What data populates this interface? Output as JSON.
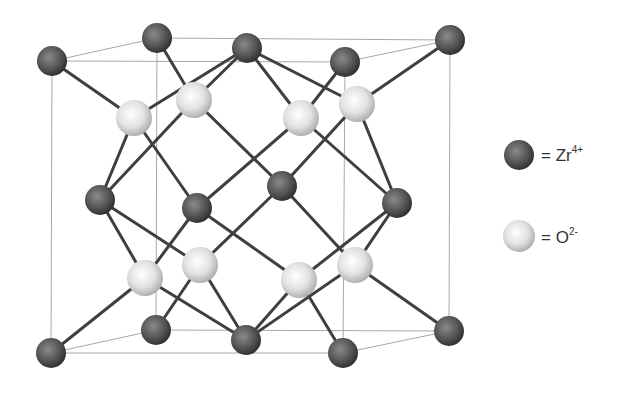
{
  "colors": {
    "zr_dark": "#3a3a3a",
    "zr_mid": "#6e6e6e",
    "o_light": "#f4f4f4",
    "o_mid": "#b8b8b8",
    "bond": "#3f3f3f",
    "box": "#a8a8a8"
  },
  "legend": [
    {
      "symbol": "Zr",
      "charge": "4+",
      "prefix": "= ",
      "type": "zr"
    },
    {
      "symbol": "O",
      "charge": "2-",
      "prefix": "= ",
      "type": "o"
    }
  ],
  "box": {
    "front": [
      [
        52,
        61
      ],
      [
        345,
        62
      ],
      [
        343,
        353
      ],
      [
        51,
        353
      ]
    ],
    "back": [
      [
        157,
        38
      ],
      [
        450,
        40
      ],
      [
        449,
        331
      ],
      [
        156,
        330
      ]
    ]
  },
  "zr_atoms": [
    [
      52,
      61
    ],
    [
      157,
      38
    ],
    [
      247,
      48
    ],
    [
      345,
      62
    ],
    [
      450,
      40
    ],
    [
      100,
      200
    ],
    [
      197,
      208
    ],
    [
      282,
      186
    ],
    [
      397,
      203
    ],
    [
      51,
      353
    ],
    [
      156,
      330
    ],
    [
      246,
      340
    ],
    [
      343,
      353
    ],
    [
      449,
      331
    ]
  ],
  "o_atoms": [
    [
      134,
      118
    ],
    [
      194,
      100
    ],
    [
      301,
      118
    ],
    [
      357,
      104
    ],
    [
      145,
      278
    ],
    [
      200,
      265
    ],
    [
      299,
      280
    ],
    [
      355,
      265
    ]
  ],
  "bonds": [
    [
      [
        52,
        61
      ],
      [
        134,
        118
      ]
    ],
    [
      [
        157,
        38
      ],
      [
        194,
        100
      ]
    ],
    [
      [
        247,
        48
      ],
      [
        134,
        118
      ]
    ],
    [
      [
        247,
        48
      ],
      [
        194,
        100
      ]
    ],
    [
      [
        247,
        48
      ],
      [
        301,
        118
      ]
    ],
    [
      [
        247,
        48
      ],
      [
        357,
        104
      ]
    ],
    [
      [
        345,
        62
      ],
      [
        301,
        118
      ]
    ],
    [
      [
        450,
        40
      ],
      [
        357,
        104
      ]
    ],
    [
      [
        134,
        118
      ],
      [
        100,
        200
      ]
    ],
    [
      [
        194,
        100
      ],
      [
        100,
        200
      ]
    ],
    [
      [
        134,
        118
      ],
      [
        197,
        208
      ]
    ],
    [
      [
        194,
        100
      ],
      [
        282,
        186
      ]
    ],
    [
      [
        301,
        118
      ],
      [
        197,
        208
      ]
    ],
    [
      [
        301,
        118
      ],
      [
        397,
        203
      ]
    ],
    [
      [
        357,
        104
      ],
      [
        282,
        186
      ]
    ],
    [
      [
        357,
        104
      ],
      [
        397,
        203
      ]
    ],
    [
      [
        100,
        200
      ],
      [
        145,
        278
      ]
    ],
    [
      [
        100,
        200
      ],
      [
        200,
        265
      ]
    ],
    [
      [
        197,
        208
      ],
      [
        145,
        278
      ]
    ],
    [
      [
        197,
        208
      ],
      [
        299,
        280
      ]
    ],
    [
      [
        282,
        186
      ],
      [
        200,
        265
      ]
    ],
    [
      [
        282,
        186
      ],
      [
        355,
        265
      ]
    ],
    [
      [
        397,
        203
      ],
      [
        299,
        280
      ]
    ],
    [
      [
        397,
        203
      ],
      [
        355,
        265
      ]
    ],
    [
      [
        145,
        278
      ],
      [
        51,
        353
      ]
    ],
    [
      [
        200,
        265
      ],
      [
        156,
        330
      ]
    ],
    [
      [
        145,
        278
      ],
      [
        246,
        340
      ]
    ],
    [
      [
        200,
        265
      ],
      [
        246,
        340
      ]
    ],
    [
      [
        299,
        280
      ],
      [
        246,
        340
      ]
    ],
    [
      [
        355,
        265
      ],
      [
        246,
        340
      ]
    ],
    [
      [
        299,
        280
      ],
      [
        343,
        353
      ]
    ],
    [
      [
        355,
        265
      ],
      [
        449,
        331
      ]
    ]
  ]
}
